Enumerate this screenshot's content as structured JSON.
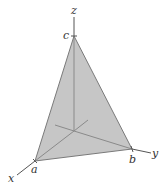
{
  "diagram": {
    "type": "3d-tetrahedron-plane",
    "colors": {
      "face_fill": "#c6c6c6",
      "edge": "#7a7a7a",
      "axis": "#555555",
      "hidden_axis": "#8a8a8a",
      "label": "#333333"
    },
    "axes": {
      "x": {
        "label": "x"
      },
      "y": {
        "label": "y"
      },
      "z": {
        "label": "z"
      }
    },
    "intercepts": {
      "a": {
        "label": "a",
        "axis": "x"
      },
      "b": {
        "label": "b",
        "axis": "y"
      },
      "c": {
        "label": "c",
        "axis": "z"
      }
    }
  }
}
